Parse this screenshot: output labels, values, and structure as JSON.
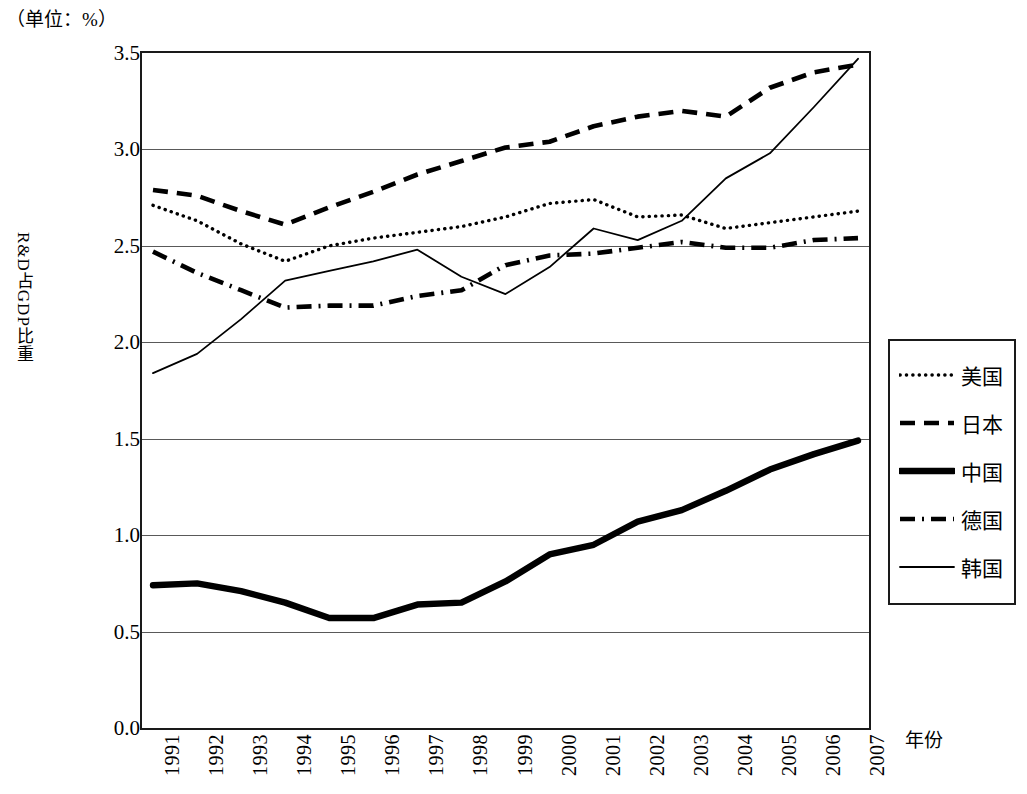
{
  "caption": {
    "unit": "（单位：%）"
  },
  "axes": {
    "y_title": "R&D占GDP比重",
    "x_title": "年份",
    "y_ticks": [
      "3.5",
      "3.0",
      "2.5",
      "2.0",
      "1.5",
      "1.0",
      "0.5",
      "0.0"
    ],
    "y_tick_values": [
      3.5,
      3.0,
      2.5,
      2.0,
      1.5,
      1.0,
      0.5,
      0.0
    ],
    "x_ticks": [
      "1991",
      "1992",
      "1993",
      "1994",
      "1995",
      "1996",
      "1997",
      "1998",
      "1999",
      "2000",
      "2001",
      "2002",
      "2003",
      "2004",
      "2005",
      "2006",
      "2007"
    ]
  },
  "legend": {
    "items": [
      {
        "label": "美国",
        "style": "dotted"
      },
      {
        "label": "日本",
        "style": "dashed"
      },
      {
        "label": "中国",
        "style": "thick-solid"
      },
      {
        "label": "德国",
        "style": "dash-dot"
      },
      {
        "label": "韩国",
        "style": "thin-solid"
      }
    ]
  },
  "chart_data": {
    "type": "line",
    "title": "",
    "subtitle": "",
    "xlabel": "年份",
    "ylabel": "R&D占GDP比重",
    "unit": "（单位：%）",
    "grid": true,
    "legend_position": "right",
    "ylim": [
      0.0,
      3.5
    ],
    "ytick_step": 0.5,
    "x": [
      1991,
      1992,
      1993,
      1994,
      1995,
      1996,
      1997,
      1998,
      1999,
      2000,
      2001,
      2002,
      2003,
      2004,
      2005,
      2006,
      2007
    ],
    "categories": [
      "1991",
      "1992",
      "1993",
      "1994",
      "1995",
      "1996",
      "1997",
      "1998",
      "1999",
      "2000",
      "2001",
      "2002",
      "2003",
      "2004",
      "2005",
      "2006",
      "2007"
    ],
    "series": [
      {
        "name": "美国",
        "style": "dotted",
        "values": [
          2.71,
          2.63,
          2.51,
          2.42,
          2.5,
          2.54,
          2.57,
          2.6,
          2.65,
          2.72,
          2.74,
          2.65,
          2.66,
          2.59,
          2.62,
          2.65,
          2.68
        ]
      },
      {
        "name": "日本",
        "style": "dashed",
        "values": [
          2.79,
          2.76,
          2.68,
          2.61,
          2.7,
          2.78,
          2.87,
          2.94,
          3.01,
          3.04,
          3.12,
          3.17,
          3.2,
          3.17,
          3.32,
          3.4,
          3.44
        ]
      },
      {
        "name": "中国",
        "style": "thick-solid",
        "values": [
          0.74,
          0.75,
          0.71,
          0.65,
          0.57,
          0.57,
          0.64,
          0.65,
          0.76,
          0.9,
          0.95,
          1.07,
          1.13,
          1.23,
          1.34,
          1.42,
          1.49
        ]
      },
      {
        "name": "德国",
        "style": "dash-dot",
        "values": [
          2.47,
          2.36,
          2.27,
          2.18,
          2.19,
          2.19,
          2.24,
          2.27,
          2.4,
          2.45,
          2.46,
          2.49,
          2.52,
          2.49,
          2.49,
          2.53,
          2.54
        ]
      },
      {
        "name": "韩国",
        "style": "thin-solid",
        "values": [
          1.84,
          1.94,
          2.12,
          2.32,
          2.37,
          2.42,
          2.48,
          2.34,
          2.25,
          2.39,
          2.59,
          2.53,
          2.63,
          2.85,
          2.98,
          3.22,
          3.47
        ]
      }
    ]
  }
}
